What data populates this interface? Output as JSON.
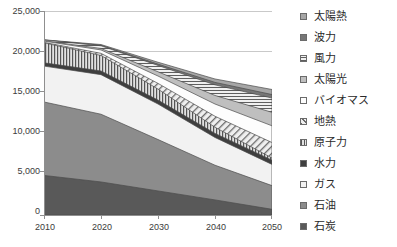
{
  "chart_data": {
    "type": "area",
    "stacked": true,
    "title": "",
    "xlabel": "",
    "ylabel": "",
    "x": [
      2010,
      2020,
      2030,
      2040,
      2050
    ],
    "xtick_labels": [
      "2010",
      "2020",
      "2030",
      "2040",
      "2050"
    ],
    "ytick_labels": [
      "0",
      "5,000",
      "10,000",
      "15,000",
      "20,000",
      "25,000"
    ],
    "ytick_values": [
      0,
      5000,
      10000,
      15000,
      20000,
      25000
    ],
    "ylim": [
      0,
      25000
    ],
    "xlim": [
      2010,
      2050
    ],
    "grid": "horizontal",
    "legend_position": "right",
    "series": [
      {
        "name": "石炭",
        "values": [
          4850,
          4050,
          2950,
          1850,
          700
        ],
        "color": "#595959",
        "pattern": "solid"
      },
      {
        "name": "石油",
        "values": [
          9000,
          8300,
          6300,
          4250,
          2900
        ],
        "color": "#8c8c8c",
        "pattern": "solid"
      },
      {
        "name": "ガス",
        "values": [
          4400,
          4850,
          4350,
          3400,
          2600
        ],
        "color": "#f2f2f2",
        "pattern": "solid"
      },
      {
        "name": "水力",
        "values": [
          400,
          450,
          480,
          500,
          520
        ],
        "color": "#3f3f3f",
        "pattern": "solid"
      },
      {
        "name": "原子力",
        "values": [
          2450,
          1900,
          1350,
          750,
          260
        ],
        "color": "#d9d9d9",
        "pattern": "vertical-lines"
      },
      {
        "name": "地熱",
        "values": [
          60,
          260,
          700,
          1350,
          1900
        ],
        "color": "#e8e8e8",
        "pattern": "diagonal-lines"
      },
      {
        "name": "バイオマス",
        "values": [
          150,
          420,
          900,
          1500,
          2050
        ],
        "color": "#fdfdfd",
        "pattern": "solid"
      },
      {
        "name": "太陽光",
        "values": [
          40,
          180,
          520,
          1050,
          1650
        ],
        "color": "#bfbfbf",
        "pattern": "solid"
      },
      {
        "name": "風力",
        "values": [
          90,
          330,
          780,
          1300,
          1750
        ],
        "color": "#ededed",
        "pattern": "horizontal-lines"
      },
      {
        "name": "波力",
        "values": [
          10,
          60,
          160,
          300,
          430
        ],
        "color": "#767676",
        "pattern": "solid"
      },
      {
        "name": "太陽熱",
        "values": [
          20,
          90,
          230,
          420,
          620
        ],
        "color": "#a6a6a6",
        "pattern": "solid"
      }
    ]
  },
  "legend": {
    "items": [
      {
        "label": "太陽熱",
        "swatch_name": "legend-swatch-solar-thermal",
        "color": "#a6a6a6",
        "pattern": "solid"
      },
      {
        "label": "波力",
        "swatch_name": "legend-swatch-wave",
        "color": "#767676",
        "pattern": "solid"
      },
      {
        "label": "風力",
        "swatch_name": "legend-swatch-wind",
        "color": "#ededed",
        "pattern": "horizontal-lines"
      },
      {
        "label": "太陽光",
        "swatch_name": "legend-swatch-solar-pv",
        "color": "#bfbfbf",
        "pattern": "solid"
      },
      {
        "label": "バイオマス",
        "swatch_name": "legend-swatch-biomass",
        "color": "#fdfdfd",
        "pattern": "solid"
      },
      {
        "label": "地熱",
        "swatch_name": "legend-swatch-geothermal",
        "color": "#e8e8e8",
        "pattern": "diagonal-lines"
      },
      {
        "label": "原子力",
        "swatch_name": "legend-swatch-nuclear",
        "color": "#d9d9d9",
        "pattern": "vertical-lines"
      },
      {
        "label": "水力",
        "swatch_name": "legend-swatch-hydro",
        "color": "#3f3f3f",
        "pattern": "solid"
      },
      {
        "label": "ガス",
        "swatch_name": "legend-swatch-gas",
        "color": "#f2f2f2",
        "pattern": "solid"
      },
      {
        "label": "石油",
        "swatch_name": "legend-swatch-oil",
        "color": "#8c8c8c",
        "pattern": "solid"
      },
      {
        "label": "石炭",
        "swatch_name": "legend-swatch-coal",
        "color": "#595959",
        "pattern": "solid"
      }
    ]
  },
  "axes": {
    "y_labels": [
      "25,000",
      "20,000",
      "15,000",
      "10,000",
      "5,000",
      "0"
    ],
    "x_labels": [
      "2010",
      "2020",
      "2030",
      "2040",
      "2050"
    ]
  },
  "colors": {
    "axis": "#9a9a9a",
    "gridline": "#c9c9c9",
    "text": "#3b3b3b",
    "plot_background": "#ffffff"
  }
}
